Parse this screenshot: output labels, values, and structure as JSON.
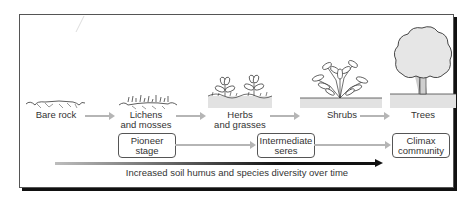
{
  "diagram": {
    "stages": [
      {
        "label_line1": "Bare rock",
        "label_line2": "",
        "icon": "bare-rock-icon"
      },
      {
        "label_line1": "Lichens",
        "label_line2": "and mosses",
        "icon": "lichens-mosses-icon"
      },
      {
        "label_line1": "Herbs",
        "label_line2": "and grasses",
        "icon": "herbs-grasses-icon"
      },
      {
        "label_line1": "Shrubs",
        "label_line2": "",
        "icon": "shrub-icon"
      },
      {
        "label_line1": "Trees",
        "label_line2": "",
        "icon": "tree-icon"
      }
    ],
    "phases": [
      {
        "line1": "Pioneer",
        "line2": "stage"
      },
      {
        "line1": "Intermediate",
        "line2": "seres"
      },
      {
        "line1": "Climax",
        "line2": "community"
      }
    ],
    "trend_label": "Increased soil humus and species diversity over time",
    "colors": {
      "frame": "#555555",
      "shadow": "#111111",
      "gray_arrow": "#b5b5b5",
      "trend_arrow": "#111111",
      "ground": "#e2e2e2",
      "foliage": "#e6e6e6"
    }
  }
}
